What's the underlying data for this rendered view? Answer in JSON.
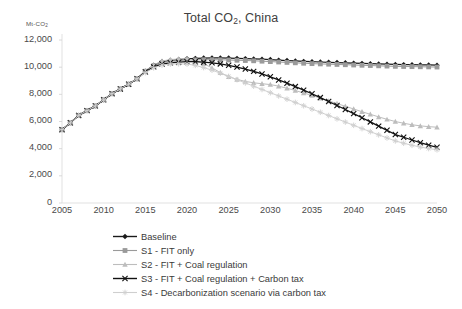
{
  "chart_data": {
    "type": "line",
    "title": "Total CO2, China",
    "title_parts": {
      "pre": "Total CO",
      "sub": "2",
      "post": ", China"
    },
    "ylabel": "Mt-CO2",
    "ylabel_parts": {
      "pre": "Mt-CO",
      "sub": "2"
    },
    "xlabel": "",
    "xlim": [
      2005,
      2050
    ],
    "ylim": [
      0,
      12000
    ],
    "yticks": [
      0,
      2000,
      4000,
      6000,
      8000,
      10000,
      12000
    ],
    "ytick_labels": [
      "0",
      "2,000",
      "4,000",
      "6,000",
      "8,000",
      "10,000",
      "12,000"
    ],
    "xticks": [
      2005,
      2010,
      2015,
      2020,
      2025,
      2030,
      2035,
      2040,
      2045,
      2050
    ],
    "xtick_labels": [
      "2005",
      "2010",
      "2015",
      "2020",
      "2025",
      "2030",
      "2035",
      "2040",
      "2045",
      "2050"
    ],
    "grid": false,
    "legend_position": "bottom",
    "x": [
      2005,
      2006,
      2007,
      2008,
      2009,
      2010,
      2011,
      2012,
      2013,
      2014,
      2015,
      2016,
      2017,
      2018,
      2019,
      2020,
      2021,
      2022,
      2023,
      2024,
      2025,
      2026,
      2027,
      2028,
      2029,
      2030,
      2031,
      2032,
      2033,
      2034,
      2035,
      2036,
      2037,
      2038,
      2039,
      2040,
      2041,
      2042,
      2043,
      2044,
      2045,
      2046,
      2047,
      2048,
      2049,
      2050
    ],
    "series": [
      {
        "name": "Baseline",
        "color": "#1a1a1a",
        "marker": "diamond",
        "values": [
          5400,
          5900,
          6450,
          6800,
          7150,
          7600,
          8050,
          8400,
          8750,
          9150,
          9700,
          10150,
          10400,
          10500,
          10560,
          10620,
          10650,
          10670,
          10680,
          10680,
          10670,
          10650,
          10630,
          10610,
          10590,
          10560,
          10520,
          10490,
          10460,
          10430,
          10400,
          10380,
          10360,
          10340,
          10320,
          10300,
          10280,
          10260,
          10240,
          10220,
          10200,
          10190,
          10180,
          10170,
          10160,
          10150
        ]
      },
      {
        "name": "S1 - FIT only",
        "color": "#9a9a9a",
        "marker": "square",
        "values": [
          5400,
          5900,
          6450,
          6800,
          7150,
          7600,
          8050,
          8400,
          8750,
          9150,
          9700,
          10100,
          10330,
          10430,
          10480,
          10520,
          10540,
          10550,
          10550,
          10540,
          10530,
          10510,
          10490,
          10470,
          10440,
          10410,
          10380,
          10350,
          10320,
          10290,
          10260,
          10240,
          10220,
          10200,
          10180,
          10160,
          10140,
          10120,
          10100,
          10080,
          10060,
          10050,
          10040,
          10030,
          10020,
          10010
        ]
      },
      {
        "name": "S2 - FIT + Coal regulation",
        "color": "#bdbdbd",
        "marker": "triangle",
        "values": [
          5400,
          5900,
          6450,
          6800,
          7150,
          7600,
          8050,
          8400,
          8750,
          9150,
          9700,
          10150,
          10450,
          10560,
          10600,
          10620,
          10480,
          10250,
          9950,
          9600,
          9300,
          9100,
          8950,
          8850,
          8780,
          8720,
          8600,
          8450,
          8280,
          8100,
          7920,
          7720,
          7520,
          7320,
          7120,
          6920,
          6720,
          6530,
          6340,
          6160,
          6000,
          5870,
          5760,
          5680,
          5620,
          5580
        ]
      },
      {
        "name": "S3 - FIT + Coal regulation + Carbon tax",
        "color": "#111111",
        "marker": "x",
        "values": [
          5400,
          5900,
          6450,
          6800,
          7150,
          7600,
          8050,
          8400,
          8750,
          9150,
          9650,
          10020,
          10230,
          10320,
          10370,
          10400,
          10400,
          10370,
          10320,
          10240,
          10140,
          10010,
          9860,
          9690,
          9500,
          9290,
          9060,
          8820,
          8570,
          8310,
          8040,
          7760,
          7470,
          7180,
          6880,
          6580,
          6280,
          5970,
          5660,
          5350,
          5040,
          4840,
          4640,
          4440,
          4260,
          4100
        ]
      },
      {
        "name": "S4 - Decarbonization scenario via carbon tax",
        "color": "#cfcfcf",
        "marker": "star",
        "values": [
          5400,
          5900,
          6450,
          6800,
          7150,
          7600,
          8050,
          8400,
          8750,
          9150,
          9600,
          9950,
          10150,
          10230,
          10250,
          10230,
          10130,
          9970,
          9780,
          9560,
          9320,
          9080,
          8840,
          8600,
          8360,
          8120,
          7880,
          7640,
          7400,
          7160,
          6920,
          6680,
          6440,
          6200,
          5960,
          5720,
          5480,
          5250,
          5020,
          4790,
          4570,
          4400,
          4250,
          4120,
          4010,
          3920
        ]
      }
    ]
  },
  "legend": {
    "items": [
      {
        "label": "Baseline"
      },
      {
        "label": "S1 - FIT only"
      },
      {
        "label": "S2 - FIT + Coal regulation"
      },
      {
        "label": "S3 - FIT + Coal regulation + Carbon tax"
      },
      {
        "label": "S4 - Decarbonization scenario via carbon tax"
      }
    ]
  }
}
